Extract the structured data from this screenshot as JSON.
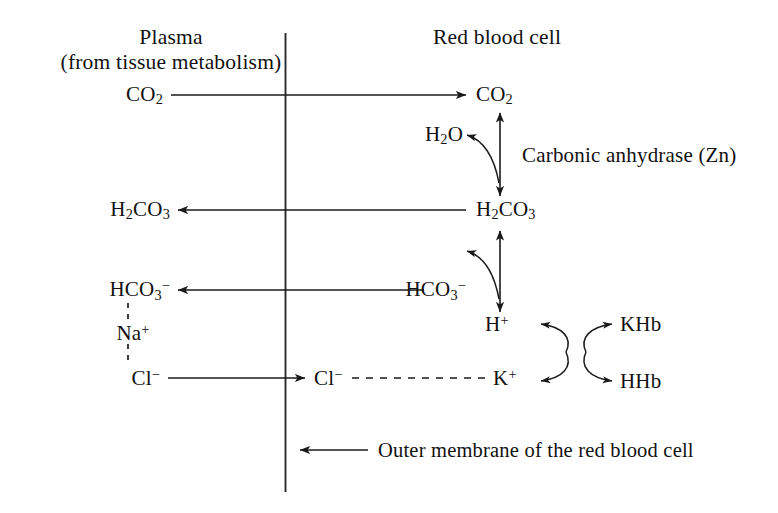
{
  "diagram": {
    "type": "biochemical-pathway",
    "stroke_color": "#1a1a1a",
    "background_color": "#ffffff",
    "headers": {
      "left_title": "Plasma",
      "left_subtitle": "(from tissue metabolism)",
      "right_title": "Red blood cell"
    },
    "enzyme_label": "Carbonic anhydrase (Zn)",
    "membrane_caption": "Outer membrane of the red blood cell",
    "species": {
      "plasma_co2": "CO2",
      "cell_co2": "CO2",
      "water": "H2O",
      "plasma_h2co3": "H2CO3",
      "cell_h2co3": "H2CO3",
      "plasma_hco3": "HCO3-",
      "cell_hco3": "HCO3-",
      "sodium": "Na+",
      "plasma_chloride": "Cl-",
      "cell_chloride": "Cl-",
      "proton": "H+",
      "potassium": "K+",
      "potassium_hemoglobin": "KHb",
      "protonated_hemoglobin": "HHb"
    },
    "species_display": {
      "co2": {
        "base": "CO",
        "sub": "2",
        "sup": ""
      },
      "h2o": {
        "base1": "H",
        "sub1": "2",
        "base2": "O"
      },
      "h2co3": {
        "b1": "H",
        "s1": "2",
        "b2": "CO",
        "s2": "3"
      },
      "hco3": {
        "b1": "HCO",
        "s1": "3",
        "sup": "−"
      },
      "na": {
        "b1": "Na",
        "sup": "+"
      },
      "cl": {
        "b1": "Cl",
        "sup": "−"
      },
      "h": {
        "b1": "H",
        "sup": "+"
      },
      "k": {
        "b1": "K",
        "sup": "+"
      },
      "khb": "KHb",
      "hhb": "HHb"
    },
    "arrows": [
      {
        "name": "co2-influx",
        "from": "plasma_co2",
        "to": "cell_co2",
        "style": "solid",
        "direction": "right"
      },
      {
        "name": "co2-h2co3-equilibrium",
        "from": "cell_co2",
        "to": "cell_h2co3",
        "style": "solid",
        "direction": "both"
      },
      {
        "name": "water-entry",
        "from": "co2-h2co3-equilibrium",
        "to": "water",
        "style": "curved",
        "direction": "left"
      },
      {
        "name": "h2co3-efflux",
        "from": "cell_h2co3",
        "to": "plasma_h2co3",
        "style": "solid",
        "direction": "left"
      },
      {
        "name": "h2co3-hco3-equilibrium",
        "from": "cell_h2co3",
        "to": "proton",
        "style": "solid",
        "direction": "both"
      },
      {
        "name": "hco3-release",
        "from": "h2co3-hco3-equilibrium",
        "to": "cell_hco3",
        "style": "curved",
        "direction": "left"
      },
      {
        "name": "hco3-efflux",
        "from": "cell_hco3",
        "to": "plasma_hco3",
        "style": "solid",
        "direction": "left"
      },
      {
        "name": "chloride-influx",
        "from": "plasma_chloride",
        "to": "cell_chloride",
        "style": "solid",
        "direction": "right"
      },
      {
        "name": "chloride-potassium-link",
        "from": "cell_chloride",
        "to": "potassium",
        "style": "dashed",
        "direction": "none"
      },
      {
        "name": "hco3-sodium-link",
        "from": "plasma_hco3",
        "to": "sodium",
        "style": "dashed",
        "direction": "none"
      },
      {
        "name": "sodium-chloride-link",
        "from": "sodium",
        "to": "plasma_chloride",
        "style": "dashed",
        "direction": "none"
      },
      {
        "name": "proton-potassium-exchange",
        "from": "proton",
        "to": "potassium",
        "style": "curved-pair",
        "direction": "both"
      },
      {
        "name": "hemoglobin-buffering",
        "from": "potassium_hemoglobin",
        "to": "protonated_hemoglobin",
        "style": "curved-pair",
        "direction": "both"
      },
      {
        "name": "membrane-pointer",
        "from": "membrane_caption",
        "to": "membrane",
        "style": "solid",
        "direction": "left"
      }
    ]
  }
}
